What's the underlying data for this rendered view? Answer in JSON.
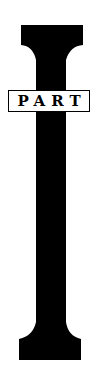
{
  "title": {
    "numeral": "I",
    "label": "PART"
  },
  "colors": {
    "ink": "#000000",
    "paper": "#ffffff"
  }
}
